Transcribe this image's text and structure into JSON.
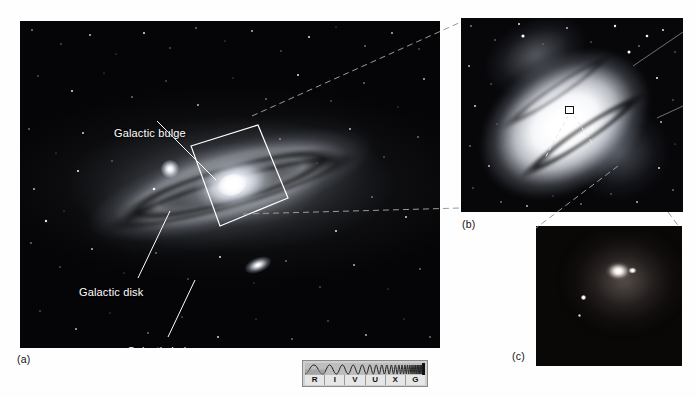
{
  "figure": {
    "kind": "textbook-astronomy-figure",
    "panels": [
      {
        "id": "a",
        "caption": "(a)",
        "description": "wide-field view of a spiral galaxy showing halo, disk and bulge",
        "annotations": [
          {
            "label": "Galactic bulge",
            "target": "bright central bulge"
          },
          {
            "label": "Galactic disk",
            "target": "flattened star-and-dust disk"
          },
          {
            "label": "Galactic halo",
            "target": "faint spherical star halo"
          }
        ]
      },
      {
        "id": "b",
        "caption": "(b)",
        "description": "magnified view of the galactic bulge with a small box marking the nucleus"
      },
      {
        "id": "c",
        "caption": "(c)",
        "description": "highest magnification view of the galactic nucleus"
      }
    ]
  },
  "spectrum_bar": {
    "name": "electromagnetic-spectrum-indicator",
    "bands": [
      "R",
      "I",
      "V",
      "U",
      "X",
      "G"
    ],
    "band_names": [
      "Radio",
      "Infrared",
      "Visible",
      "Ultraviolet",
      "X-ray",
      "Gamma ray"
    ],
    "highlighted": "V",
    "colors": {
      "frame": "#8a8a8a",
      "body": "#cfcfcf",
      "wave_bg": "#bdbdbd",
      "letter_bg": "#e6e6e6",
      "ink": "#111111"
    }
  },
  "colors": {
    "page_background": "#ffffff",
    "panel_background": "#000000",
    "annotation_text": "#ffffff",
    "caption_text": "#111111",
    "leader_line": "#ffffff",
    "connector_line": "#9a9a9a"
  }
}
